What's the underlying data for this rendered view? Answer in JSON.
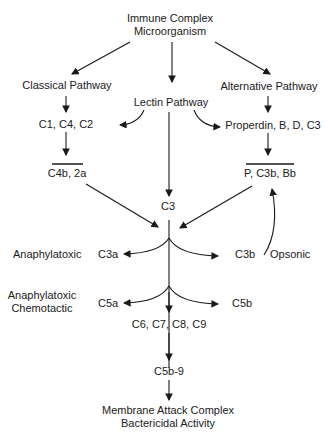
{
  "diagram": {
    "trigger": {
      "line1": "Immune Complex",
      "line2": "Microorganism"
    },
    "pathways": {
      "classical": "Classical Pathway",
      "lectin": "Lectin Pathway",
      "alternative": "Alternative Pathway"
    },
    "components": {
      "classical_components": "C1, C4, C2",
      "alternative_components": "Properdin, B, D, C3",
      "classical_convertase": "C4b, 2a",
      "alternative_convertase": "P, C3b, Bb",
      "c3": "C3",
      "c3a": "C3a",
      "c3b": "C3b",
      "c5a": "C5a",
      "c5b": "C5b",
      "late": "C6, C7, C8, C9",
      "c5b9": "C5b-9"
    },
    "annotations": {
      "c3a_effect": "Anaphylatoxic",
      "c3b_effect": "Opsonic",
      "c5a_effect_1": "Anaphylatoxic",
      "c5a_effect_2": "Chemotactic"
    },
    "outcome": {
      "line1": "Membrane Attack Complex",
      "line2": "Bactericidal Activity"
    }
  }
}
